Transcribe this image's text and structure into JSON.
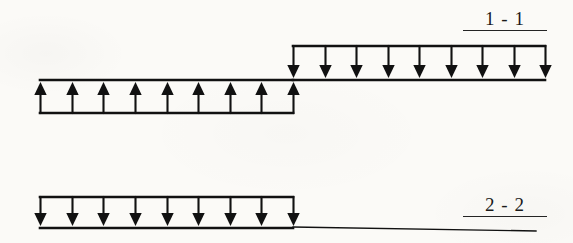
{
  "figure": {
    "type": "engineering-load-diagram",
    "background_color": "#fbfaf7",
    "line_color": "#111111"
  },
  "diagrams": [
    {
      "id": "section-1-1",
      "label": "1 - 1",
      "label_underlined": true,
      "blocks": [
        {
          "id": "block-1-1-lower-left",
          "direction": "up",
          "arrow_count": 9,
          "x_start": 40,
          "x_end": 293,
          "rail_y": 80,
          "tip_y": 82,
          "tail_y": 113
        },
        {
          "id": "block-1-1-upper-right",
          "direction": "down",
          "arrow_count": 9,
          "x_start": 293,
          "x_end": 545,
          "rail_y": 80,
          "tip_y": 78,
          "tail_y": 46
        }
      ]
    },
    {
      "id": "section-2-2",
      "label": "2 - 2",
      "label_underlined": true,
      "blocks": [
        {
          "id": "block-2-2-left",
          "direction": "down",
          "arrow_count": 9,
          "x_start": 40,
          "x_end": 293,
          "rail_y": 228,
          "tip_y": 226,
          "tail_y": 197
        }
      ],
      "baseline": {
        "id": "baseline-2-2",
        "x_start": 293,
        "x_end": 536,
        "y_start": 227,
        "y_end": 231
      }
    }
  ],
  "chart_data": {
    "type": "bar",
    "title": "",
    "xlabel": "",
    "ylabel": "",
    "series": [
      {
        "name": "1 - 1",
        "segments": [
          {
            "span": "left",
            "sign": "positive",
            "arrows": 9,
            "direction": "up"
          },
          {
            "span": "right",
            "sign": "negative",
            "arrows": 9,
            "direction": "down"
          }
        ]
      },
      {
        "name": "2 - 2",
        "segments": [
          {
            "span": "left",
            "sign": "negative",
            "arrows": 9,
            "direction": "down"
          },
          {
            "span": "right",
            "sign": "zero",
            "arrows": 0,
            "direction": "none"
          }
        ]
      }
    ]
  }
}
